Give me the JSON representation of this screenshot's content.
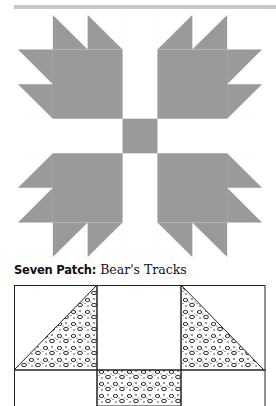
{
  "caption": {
    "label": "Seven Patch:",
    "title": " Bear's Tracks"
  },
  "colors": {
    "rule": "#c8c8c8",
    "fill_gray": "#9a9a9a",
    "line": "#222222",
    "background": "#ffffff"
  },
  "quilt_block_top": {
    "name": "Bear's Tracks",
    "grid": "7x7",
    "center_square": "gray",
    "sashing": "white"
  },
  "quilt_block_bottom": {
    "grid": "3 columns, partial",
    "fill": "leopard-print pattern"
  }
}
